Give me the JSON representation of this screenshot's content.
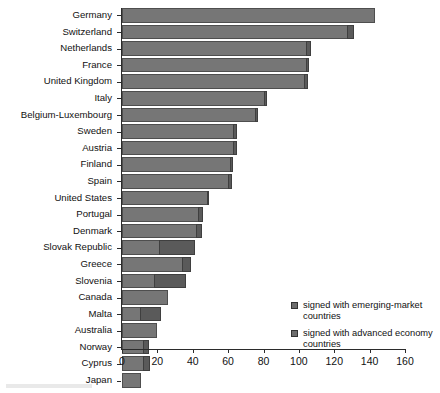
{
  "chart_data": {
    "type": "bar",
    "orientation": "horizontal",
    "stacked": true,
    "title": "",
    "subtitle": "",
    "xlabel": "",
    "ylabel": "",
    "xlim": [
      0,
      160
    ],
    "xticks": [
      0,
      20,
      40,
      60,
      80,
      100,
      120,
      140,
      160
    ],
    "xtick_labels": [
      "0",
      "20",
      "40",
      "60",
      "80",
      "100",
      "120",
      "140",
      "160"
    ],
    "grid": false,
    "legend_position": "inside-lower-right",
    "categories": [
      "Germany",
      "Switzerland",
      "Netherlands",
      "France",
      "United Kingdom",
      "Italy",
      "Belgium-Luxembourg",
      "Sweden",
      "Austria",
      "Finland",
      "Spain",
      "United States",
      "Portugal",
      "Denmark",
      "Slovak Republic",
      "Greece",
      "Slovenia",
      "Canada",
      "Malta",
      "Australia",
      "Norway",
      "Cyprus",
      "Japan"
    ],
    "series": [
      {
        "name": "signed with advanced economy countries",
        "color": "#767676",
        "values": [
          143,
          127,
          104,
          104,
          103,
          80,
          75,
          63,
          63,
          61,
          60,
          48,
          43,
          42,
          21,
          34,
          18,
          26,
          10,
          20,
          12,
          12,
          11
        ]
      },
      {
        "name": "signed with emerging-market countries",
        "color": "#5a5a5a",
        "values": [
          0,
          4,
          3,
          2,
          2,
          2,
          2,
          2,
          2,
          2,
          2,
          1,
          3,
          3,
          20,
          5,
          18,
          0,
          12,
          0,
          3,
          4,
          0
        ]
      }
    ],
    "totals": [
      143,
      131,
      107,
      106,
      105,
      82,
      77,
      65,
      65,
      63,
      62,
      49,
      46,
      45,
      41,
      39,
      36,
      26,
      22,
      20,
      15,
      16,
      11
    ]
  },
  "legend": {
    "items": [
      {
        "swatch": "emerging-swatch",
        "label": "signed with emerging-market countries"
      },
      {
        "swatch": "advanced-swatch",
        "label": "signed with advanced economy countries"
      }
    ]
  }
}
